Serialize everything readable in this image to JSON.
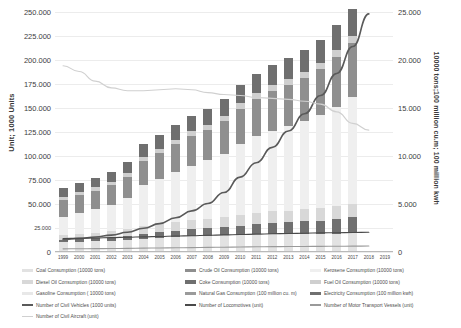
{
  "axes": {
    "y_left_title": "Unit; 1000 Units",
    "y_right_title": "10000 tons;100 million cu.m; 100 million kwh",
    "y_left_ticks": [
      "0",
      "25.000",
      "50.000",
      "75.000",
      "100.000",
      "125.000",
      "150.000",
      "175.000",
      "200.000",
      "225.000",
      "250.000"
    ],
    "y_right_ticks": [
      "0",
      "5.000",
      "10.000",
      "15.000",
      "20.000",
      "25.000"
    ],
    "x_ticks": [
      "1999",
      "2000",
      "2001",
      "2002",
      "2003",
      "2004",
      "2005",
      "2006",
      "2007",
      "2008",
      "2009",
      "2010",
      "2011",
      "2012",
      "2013",
      "2014",
      "2015",
      "2016",
      "2017",
      "2018",
      "2019"
    ]
  },
  "legend": {
    "col1": [
      {
        "label": "Coal Consumption (10000 tons)",
        "marker": "bar",
        "color": "#e2e2e2"
      },
      {
        "label": "Diesel Oil Consumption (10000 tons)",
        "marker": "bar",
        "color": "#d8d8d8"
      },
      {
        "label": "Gasoline Consumption ( 10000 tons)",
        "marker": "bar",
        "color": "#e8e8e8"
      },
      {
        "label": "Number of Civil Vehicles (1000 units)",
        "marker": "line",
        "color": "#5a5a5a"
      },
      {
        "label": "Number of Civil Aircraft (unit)",
        "marker": "line",
        "color": "#d0d0d0"
      }
    ],
    "col2": [
      {
        "label": "Crude Oil Consumption (10000 tons)",
        "marker": "bar",
        "color": "#8f8f8f"
      },
      {
        "label": "Coke Consumption (10000 tons)",
        "marker": "bar",
        "color": "#6f6f6f"
      },
      {
        "label": "Natural Gas Consumption (100 million cu. m)",
        "marker": "bar",
        "color": "#9b9b9b"
      },
      {
        "label": "Number of Locomotives (unit)",
        "marker": "line",
        "color": "#4a4a4a"
      }
    ],
    "col3": [
      {
        "label": "Kerosene Consumption (10000 tons)",
        "marker": "bar",
        "color": "#efefef"
      },
      {
        "label": "Fuel Oil Consumption (10000 tons)",
        "marker": "bar",
        "color": "#cfcfcf"
      },
      {
        "label": "Electricity Consumption (100 million kwh)",
        "marker": "bar",
        "color": "#707070"
      },
      {
        "label": "Number of Motor Transport Vessels (unit)",
        "marker": "line",
        "color": "#9a9a9a"
      }
    ]
  },
  "chart_data": {
    "type": "bar",
    "title": "",
    "xlabel": "",
    "ylabel": "Unit; 1000 Units",
    "ylabel_secondary": "10000 tons;100 million cu.m; 100 million kwh",
    "ylim": [
      0,
      250000
    ],
    "ylim_secondary": [
      0,
      25000
    ],
    "grid": true,
    "legend_position": "bottom",
    "stacked": true,
    "categories": [
      "1999",
      "2000",
      "2001",
      "2002",
      "2003",
      "2004",
      "2005",
      "2006",
      "2007",
      "2008",
      "2009",
      "2010",
      "2011",
      "2012",
      "2013",
      "2014",
      "2015",
      "2016",
      "2017",
      "2018",
      "2019"
    ],
    "series": [
      {
        "name": "Coal Consumption (10000 tons)",
        "axis": "left",
        "type": "bar",
        "color": "#e2e2e2",
        "values": [
          10000,
          10500,
          11000,
          11500,
          12500,
          14000,
          15000,
          16000,
          16500,
          17000,
          17500,
          18000,
          18500,
          19000,
          19000,
          19000,
          19000,
          19000,
          19500,
          null,
          null
        ]
      },
      {
        "name": "Crude Oil Consumption (10000 tons)",
        "axis": "left",
        "type": "bar",
        "color": "#8f8f8f",
        "values": [
          18000,
          18500,
          19000,
          20000,
          22000,
          25000,
          27000,
          29000,
          31000,
          32000,
          34000,
          37000,
          39000,
          41000,
          43000,
          45000,
          48000,
          52000,
          56000,
          null,
          null
        ]
      },
      {
        "name": "Kerosene Consumption (10000 tons)",
        "axis": "left",
        "type": "bar",
        "color": "#efefef",
        "values": [
          19000,
          22000,
          25000,
          28000,
          33000,
          43000,
          47000,
          52000,
          57000,
          61000,
          66000,
          74000,
          80000,
          84000,
          88000,
          92000,
          97000,
          104000,
          112000,
          null,
          null
        ]
      },
      {
        "name": "Diesel Oil Consumption (10000 tons)",
        "axis": "left",
        "type": "bar",
        "color": "#d8d8d8",
        "values": [
          5000,
          5500,
          6000,
          6500,
          7000,
          8000,
          8500,
          9000,
          9500,
          10000,
          10500,
          11000,
          11500,
          12000,
          12000,
          12500,
          13000,
          13500,
          14000,
          null,
          null
        ]
      },
      {
        "name": "Coke Consumption (10000 tons)",
        "axis": "left",
        "type": "bar",
        "color": "#6f6f6f",
        "values": [
          9000,
          9500,
          10000,
          10500,
          11500,
          13000,
          14000,
          15000,
          16000,
          16500,
          17500,
          19000,
          20000,
          21000,
          22000,
          23000,
          24000,
          26000,
          28000,
          null,
          null
        ]
      },
      {
        "name": "Fuel Oil Consumption (10000 tons)",
        "axis": "left",
        "type": "bar",
        "color": "#cfcfcf",
        "values": [
          3000,
          3200,
          3400,
          3600,
          3800,
          4200,
          4500,
          4800,
          5000,
          5200,
          5500,
          5800,
          6000,
          6200,
          6400,
          6600,
          6800,
          7000,
          7200,
          null,
          null
        ]
      },
      {
        "name": "Electricity Consumption (100 million kwh)",
        "axis": "left",
        "type": "bar",
        "color": "#707070",
        "values": [
          2500,
          2800,
          3100,
          3500,
          4000,
          5000,
          5600,
          6300,
          7000,
          7600,
          8300,
          9500,
          10500,
          11300,
          12000,
          12800,
          13600,
          15000,
          16500,
          null,
          null
        ]
      }
    ],
    "lines": [
      {
        "name": "Number of Civil Vehicles (1000 units)",
        "axis": "right",
        "type": "line",
        "color": "#5a5a5a",
        "values": [
          1300,
          1420,
          1560,
          1760,
          2050,
          2470,
          2960,
          3560,
          4280,
          5050,
          6200,
          7800,
          9300,
          10900,
          12600,
          14400,
          16300,
          18600,
          21400,
          24800,
          null
        ]
      },
      {
        "name": "Number of Civil Aircraft (unit)",
        "axis": "right",
        "type": "line",
        "color": "#d0d0d0",
        "values": [
          19400,
          18800,
          17800,
          17100,
          16800,
          16800,
          16900,
          17000,
          16900,
          16600,
          16400,
          16300,
          16100,
          16000,
          15900,
          15700,
          15400,
          14600,
          13400,
          12700,
          null
        ]
      },
      {
        "name": "Number of Locomotives (unit)",
        "axis": "right",
        "type": "line",
        "color": "#4a4a4a",
        "values": [
          1400,
          1430,
          1460,
          1500,
          1540,
          1580,
          1620,
          1660,
          1700,
          1740,
          1780,
          1820,
          1860,
          1900,
          1930,
          1960,
          1990,
          2010,
          2030,
          2050,
          null
        ]
      },
      {
        "name": "Number of Motor Transport Vessels (unit)",
        "axis": "right",
        "type": "line",
        "color": "#9a9a9a",
        "values": [
          330,
          340,
          350,
          360,
          380,
          400,
          420,
          440,
          460,
          480,
          500,
          520,
          540,
          560,
          570,
          580,
          590,
          600,
          610,
          620,
          null
        ]
      }
    ]
  }
}
